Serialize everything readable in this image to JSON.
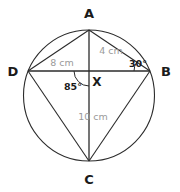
{
  "figure": {
    "kind": "cyclic-quadrilateral-with-intersecting-diagonals",
    "background_color": "#ffffff",
    "stroke_color": "#2b2b2b",
    "dimension_text_color": "#9a9a9a",
    "angle_text_color": "#1a1a1a",
    "vertex_text_color": "#1a1a1a"
  },
  "circle": {
    "name": "circumcircle",
    "cx": 89,
    "cy": 95.5,
    "r": 65.5
  },
  "vertices": [
    {
      "id": "A",
      "label": "A",
      "x": 89,
      "y": 30,
      "label_x": 89,
      "label_y": 18
    },
    {
      "id": "B",
      "label": "B",
      "x": 150,
      "y": 71,
      "label_x": 166,
      "label_y": 76
    },
    {
      "id": "C",
      "label": "C",
      "x": 89,
      "y": 161,
      "label_x": 89,
      "label_y": 184
    },
    {
      "id": "D",
      "label": "D",
      "x": 28,
      "y": 71,
      "label_x": 13,
      "label_y": 76
    }
  ],
  "intersection": {
    "id": "X",
    "label": "X",
    "x": 89,
    "y": 71,
    "label_x": 97,
    "label_y": 86
  },
  "segments": [
    {
      "name": "chord-AB",
      "from": "A",
      "to": "B"
    },
    {
      "name": "chord-BC",
      "from": "B",
      "to": "C"
    },
    {
      "name": "chord-CD",
      "from": "C",
      "to": "D"
    },
    {
      "name": "chord-DA",
      "from": "D",
      "to": "A"
    },
    {
      "name": "diagonal-AC",
      "from": "A",
      "to": "C"
    },
    {
      "name": "diagonal-DB",
      "from": "D",
      "to": "B"
    }
  ],
  "dimensions": [
    {
      "name": "segment-DX-length",
      "text": "8 cm",
      "x": 62,
      "y": 66,
      "segment": "DX"
    },
    {
      "name": "segment-AX-length",
      "text": "4 cm",
      "x": 111,
      "y": 54,
      "segment": "AX"
    },
    {
      "name": "segment-XC-length",
      "text": "10 cm",
      "x": 93,
      "y": 120,
      "segment": "XC"
    }
  ],
  "angles": [
    {
      "name": "angle-at-B",
      "text": "30°",
      "x": 138,
      "y": 67,
      "vertex": "B",
      "arc": {
        "cx": 150,
        "cy": 71,
        "r": 16,
        "start_deg": 180,
        "end_deg": 214
      }
    },
    {
      "name": "angle-at-X",
      "text": "85°",
      "x": 73,
      "y": 90,
      "vertex": "X",
      "arc": {
        "cx": 89,
        "cy": 71,
        "r": 15,
        "start_deg": 90,
        "end_deg": 180
      }
    }
  ],
  "caption": {
    "alt": "Circle with inscribed quadrilateral ABCD, diagonals AC and DB meeting at X; DX = 8 cm, AX = 4 cm, XC = 10 cm, angle at B = 30 degrees, angle at X = 85 degrees."
  }
}
